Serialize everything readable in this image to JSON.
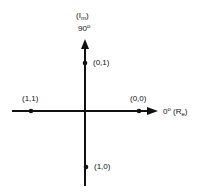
{
  "diagram": {
    "type": "constellation-axes",
    "axes": {
      "vertical": {
        "label_main": "(I",
        "label_sub": "m",
        "label_close": ")",
        "angle": "90",
        "degree": "o"
      },
      "horizontal": {
        "angle": "0",
        "degree": "o",
        "label_main": "(R",
        "label_sub": "e",
        "label_close": ")"
      }
    },
    "points": [
      {
        "label": "(0,1)",
        "position": "top"
      },
      {
        "label": "(1,1)",
        "position": "left"
      },
      {
        "label": "(0,0)",
        "position": "right"
      },
      {
        "label": "(1,0)",
        "position": "bottom"
      }
    ],
    "colors": {
      "ink": "#111111",
      "background": "#ffffff"
    }
  }
}
